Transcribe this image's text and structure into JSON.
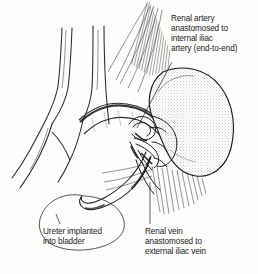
{
  "figure": {
    "type": "medical-line-illustration",
    "background_color": "#fdfdfc",
    "ink_color": "#1b1b1b"
  },
  "labels": {
    "renal_artery": {
      "line1": "Renal artery",
      "line2": "anastomosed to",
      "line3": "internal iliac",
      "line4": "artery (end-to-end)"
    },
    "renal_vein": {
      "line1": "Renal vein",
      "line2": "anastomosed to",
      "line3": "external iliac vein"
    },
    "ureter": {
      "line1": "Ureter implanted",
      "line2": "into bladder"
    }
  },
  "anatomy": {
    "kidney": "transplanted-kidney",
    "bladder": "bladder",
    "ureter": "ureter",
    "aorta": "aorta-iliac-bifurcation",
    "vena_cava": "vena-cava",
    "renal_artery_vessel": "renal-artery",
    "renal_vein_vessel": "renal-vein",
    "hatching_upper": "tissue-hatching-upper",
    "hatching_lower": "tissue-hatching-lower"
  }
}
